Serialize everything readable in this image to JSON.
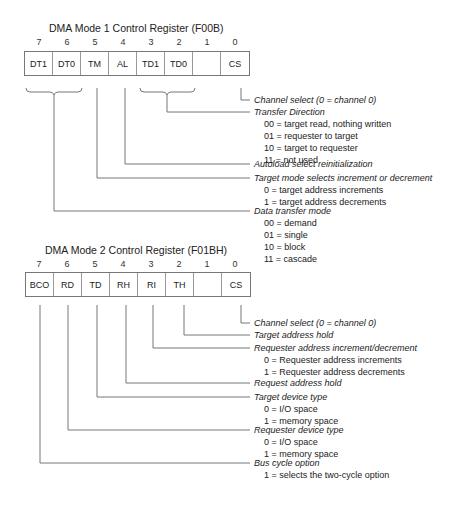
{
  "register1": {
    "title": "DMA Mode 1 Control Register (F00B)",
    "bits": [
      {
        "num": "7",
        "label": "DT1"
      },
      {
        "num": "6",
        "label": "DT0"
      },
      {
        "num": "5",
        "label": "TM"
      },
      {
        "num": "4",
        "label": "AL"
      },
      {
        "num": "3",
        "label": "TD1"
      },
      {
        "num": "2",
        "label": "TD0"
      },
      {
        "num": "1",
        "label": ""
      },
      {
        "num": "0",
        "label": "CS"
      }
    ],
    "fields": [
      {
        "head": "Channel select (0 = channel 0)",
        "options": []
      },
      {
        "head": "Transfer Direction",
        "options": [
          "00 = target read, nothing written",
          "01 = requester to target",
          "10 = target to requester",
          "11 = not used"
        ]
      },
      {
        "head": "Autoload select reinitialization",
        "options": []
      },
      {
        "head": "Target mode selects increment or decrement",
        "options": [
          "0 = target address increments",
          "1 = target address decrements"
        ]
      },
      {
        "head": "Data transfer mode",
        "options": [
          "00 = demand",
          "01 = single",
          "10 = block",
          "11 = cascade"
        ]
      }
    ]
  },
  "register2": {
    "title": "DMA Mode 2 Control Register (F01BH)",
    "bits": [
      {
        "num": "7",
        "label": "BCO"
      },
      {
        "num": "6",
        "label": "RD"
      },
      {
        "num": "5",
        "label": "TD"
      },
      {
        "num": "4",
        "label": "RH"
      },
      {
        "num": "3",
        "label": "RI"
      },
      {
        "num": "2",
        "label": "TH"
      },
      {
        "num": "1",
        "label": ""
      },
      {
        "num": "0",
        "label": "CS"
      }
    ],
    "fields": [
      {
        "head": "Channel select (0 = channel 0)",
        "options": []
      },
      {
        "head": "Target address hold",
        "options": []
      },
      {
        "head": "Requester address increment/decrement",
        "options": [
          "0 = Requester address increments",
          "1 = Requester address decrements"
        ]
      },
      {
        "head": "Request address hold",
        "options": []
      },
      {
        "head": "Target device type",
        "options": [
          "0 = I/O space",
          "1 = memory space"
        ]
      },
      {
        "head": "Requester device type",
        "options": [
          "0 = I/O space",
          "1 = memory space"
        ]
      },
      {
        "head": "Bus cycle option",
        "options": [
          "1 = selects the two-cycle option"
        ]
      }
    ]
  }
}
